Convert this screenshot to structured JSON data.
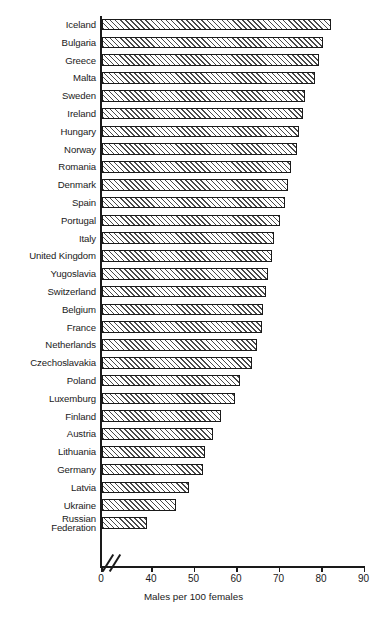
{
  "chart_data": {
    "type": "bar",
    "orientation": "horizontal",
    "title": "",
    "xlabel": "Males per 100 females",
    "ylabel": "",
    "xlim": [
      0,
      90
    ],
    "axis_break": {
      "from": 0,
      "to": 40,
      "present": true
    },
    "xticks": [
      0,
      40,
      50,
      60,
      70,
      80,
      90
    ],
    "grid": false,
    "legend": null,
    "bar_style": {
      "fill": "hatched-diagonal",
      "edge_color": "#1a1a1a",
      "hatch_color": "#4a4a4a",
      "face_color": "#ffffff"
    },
    "categories": [
      "Iceland",
      "Bulgaria",
      "Greece",
      "Malta",
      "Sweden",
      "Ireland",
      "Hungary",
      "Norway",
      "Romania",
      "Denmark",
      "Spain",
      "Portugal",
      "Italy",
      "United Kingdom",
      "Yugoslavia",
      "Switzerland",
      "Belgium",
      "France",
      "Netherlands",
      "Czechoslavakia",
      "Poland",
      "Luxemburg",
      "Finland",
      "Austria",
      "Lithuania",
      "Germany",
      "Latvia",
      "Ukraine",
      "Russian Federation"
    ],
    "values": [
      82.0,
      80.2,
      79.4,
      78.4,
      76.0,
      75.6,
      74.6,
      74.2,
      72.8,
      72.0,
      71.4,
      70.2,
      68.8,
      68.2,
      67.4,
      66.8,
      66.2,
      65.8,
      64.6,
      63.6,
      60.6,
      59.6,
      56.2,
      54.4,
      52.4,
      52.0,
      48.6,
      45.6,
      36.0
    ]
  },
  "axis": {
    "x_title": "Males per 100 females",
    "tick_labels": [
      "0",
      "40",
      "50",
      "60",
      "70",
      "80",
      "90"
    ]
  },
  "labels": {
    "russian_federation_line1": "Russian",
    "russian_federation_line2": "Federation"
  }
}
